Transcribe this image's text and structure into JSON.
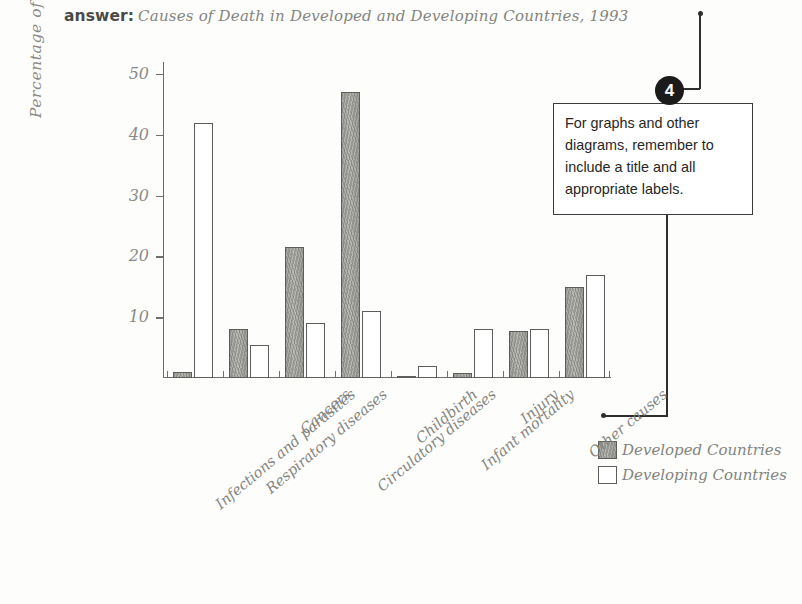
{
  "header": {
    "answer_label": "answer:",
    "title": "Causes of Death in Developed and Developing Countries, 1993"
  },
  "callout": {
    "number": "4",
    "text": "For graphs and other diagrams, remember to include a title and all appropriate labels."
  },
  "legend": {
    "items": [
      {
        "label": "Developed Countries",
        "style": "shaded",
        "color": "#b0b0ab"
      },
      {
        "label": "Developing Countries",
        "style": "outline",
        "color": "#ffffff"
      }
    ]
  },
  "chart_data": {
    "type": "bar",
    "title": "Causes of Death in Developed and Developing Countries, 1993",
    "xlabel": "",
    "ylabel": "Percentage of Deaths",
    "ylim": [
      0,
      52
    ],
    "yticks": [
      10,
      20,
      30,
      40,
      50
    ],
    "grid": false,
    "legend_position": "bottom-right",
    "categories": [
      "Infections and parasites",
      "Respiratory diseases",
      "Cancers",
      "Circulatory diseases",
      "Childbirth",
      "Infant mortality",
      "Injury",
      "Other causes"
    ],
    "series": [
      {
        "name": "Developed Countries",
        "values": [
          1,
          8,
          21.5,
          47,
          0.3,
          0.8,
          7.8,
          15
        ]
      },
      {
        "name": "Developing Countries",
        "values": [
          42,
          5.5,
          9,
          11,
          2,
          8,
          8,
          17
        ]
      }
    ]
  }
}
